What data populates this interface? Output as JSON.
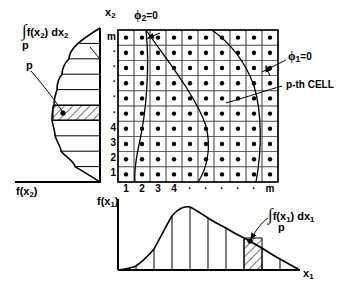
{
  "figure": {
    "type": "statistical-cell-diagram"
  },
  "left_plot": {
    "integral_label": "f(x",
    "integral_sign": "∫",
    "integral_var_sub": "2",
    "integral_dx": ") dx",
    "integral_dx_sub": "2",
    "integral_limit": "p",
    "point_label": "p",
    "axis_label_vertical": "x",
    "axis_label_vertical_sub": "2",
    "axis_label_horizontal": "f(x",
    "axis_label_horizontal_sub": "2",
    "axis_label_horizontal_close": ")",
    "bands": 10,
    "hatched_band_index": 5
  },
  "grid": {
    "rows": 10,
    "cols": 10,
    "row_labels": [
      "1",
      "2",
      "3",
      "4",
      "·",
      "·",
      "·",
      "·",
      "·",
      "m"
    ],
    "col_labels": [
      "1",
      "2",
      "3",
      "4",
      "·",
      "·",
      "·",
      "·",
      "·",
      "m"
    ],
    "cell_marker": "dot",
    "annotations": {
      "phi2": "ϕ",
      "phi2_sub": "2",
      "phi2_eq": "=0",
      "phi1": "ϕ",
      "phi1_sub": "1",
      "phi1_eq": "=0",
      "cell": "p-th CELL"
    }
  },
  "bottom_plot": {
    "y_axis_label": "f(x",
    "y_axis_label_sub": "1",
    "y_axis_label_close": ")",
    "x_axis_label": "x",
    "x_axis_label_sub": "1",
    "integral_sign": "∫",
    "integral_label": "f(x",
    "integral_var_sub": "1",
    "integral_dx": ") dx",
    "integral_dx_sub": "1",
    "integral_limit": "p",
    "bands": 10,
    "hatched_band_index": 6
  },
  "chart_data": {
    "type": "line",
    "title": "",
    "xlabel": "x1",
    "ylabel": "f(x1)",
    "series": [
      {
        "name": "f(x2) marginal density (left, horizontal)",
        "orientation": "vertical-axis",
        "y": [
          1,
          2,
          3,
          4,
          5,
          6,
          7,
          8,
          9,
          10
        ],
        "values": [
          0.97,
          0.62,
          0.38,
          0.26,
          0.22,
          0.28,
          0.46,
          0.72,
          0.92,
          0.8
        ]
      },
      {
        "name": "f(x1) marginal density (bottom)",
        "orientation": "horizontal-axis",
        "x": [
          1,
          2,
          3,
          4,
          5,
          6,
          7,
          8,
          9,
          10
        ],
        "values": [
          0.06,
          0.3,
          0.78,
          0.99,
          0.85,
          0.68,
          0.53,
          0.39,
          0.24,
          0.06
        ]
      }
    ],
    "grid": true,
    "legend": "none"
  }
}
